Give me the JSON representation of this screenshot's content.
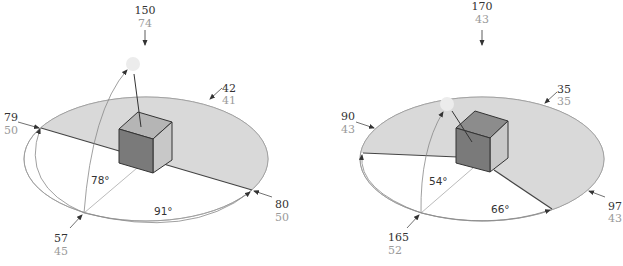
{
  "colors": {
    "shade": "#d9d9d9",
    "cube_front": "#7a7a7a",
    "cube_top": "#b5b5b5",
    "cube_right": "#c8c8c8",
    "sun": "#ececec",
    "label_dark": "#333333",
    "label_grey": "#9a9a9a",
    "ellipse_stroke": "#999999"
  },
  "diagrams": [
    {
      "sun": {
        "label_top": "150",
        "label_bottom": "74"
      },
      "left_edge": {
        "label_top": "79",
        "label_bottom": "50"
      },
      "far_edge": {
        "label_top": "42",
        "label_bottom": "41"
      },
      "right_edge": {
        "label_top": "80",
        "label_bottom": "50"
      },
      "observer": {
        "label_top": "57",
        "label_bottom": "45"
      },
      "elevation_angle": "78°",
      "azimuth_angle": "91°"
    },
    {
      "sun": {
        "label_top": "170",
        "label_bottom": "43"
      },
      "left_edge": {
        "label_top": "90",
        "label_bottom": "43"
      },
      "far_edge": {
        "label_top": "35",
        "label_bottom": "35"
      },
      "right_edge": {
        "label_top": "97",
        "label_bottom": "43"
      },
      "observer": {
        "label_top": "165",
        "label_bottom": "52"
      },
      "elevation_angle": "54°",
      "azimuth_angle": "66°"
    }
  ]
}
